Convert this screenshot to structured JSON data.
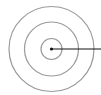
{
  "diagram": {
    "type": "concentric-circles-target",
    "canvas": {
      "width": 101,
      "height": 95,
      "background": "#ffffff"
    },
    "center": {
      "x": 51.5,
      "y": 49
    },
    "rings": [
      {
        "name": "outer-ring",
        "radius": 42.5,
        "stroke": "#9a9a9a",
        "stroke_width": 1.2
      },
      {
        "name": "middle-ring",
        "radius": 27,
        "stroke": "#9a9a9a",
        "stroke_width": 1.2
      },
      {
        "name": "inner-ring",
        "radius": 10.5,
        "stroke": "#9a9a9a",
        "stroke_width": 1.2
      }
    ],
    "center_dot": {
      "radius": 1.6,
      "fill": "#111111"
    },
    "radius_line": {
      "x2": 101,
      "stroke": "#111111",
      "stroke_width": 1
    }
  }
}
